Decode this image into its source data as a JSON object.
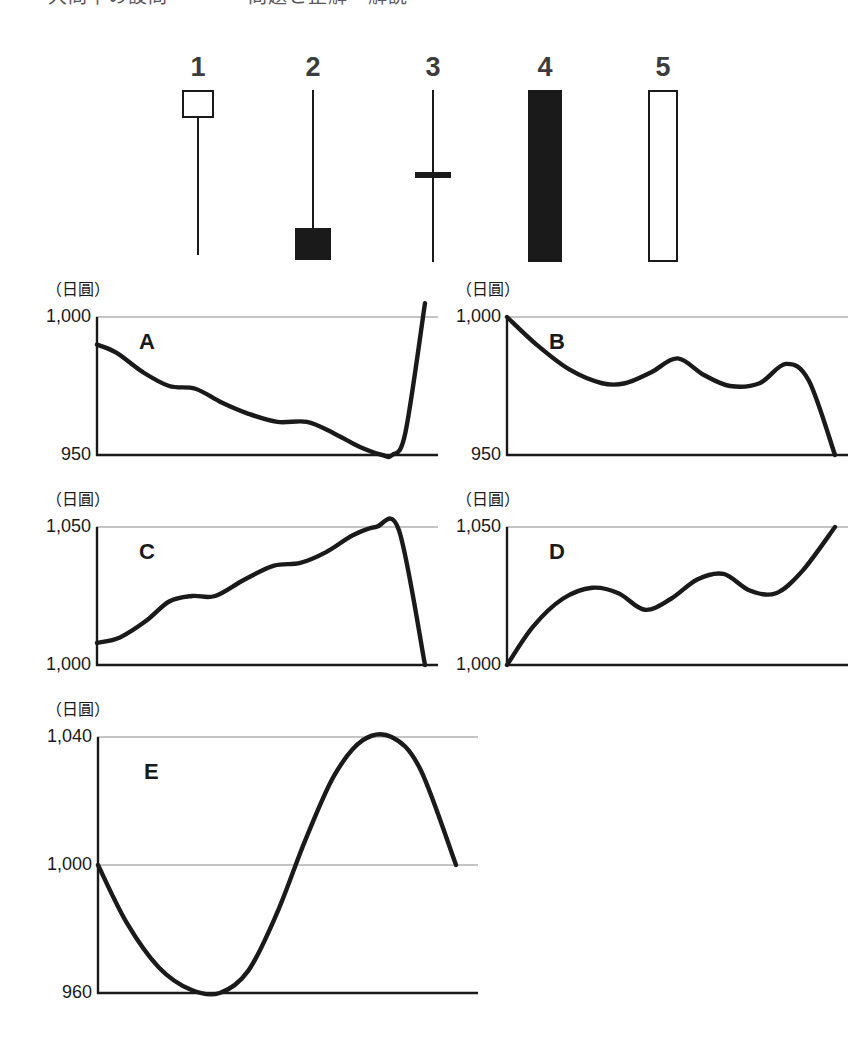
{
  "top_clipped_heading": "大問中の設問　　　　問題と正解・解説",
  "candlesticks": {
    "items": [
      {
        "label": "1",
        "icon": "candlestick-hollow-top-long-lower-wick",
        "type": "hollow",
        "body_top": 0,
        "body_height": 28,
        "body_width": 32,
        "wick_top": 28,
        "wick_height": 137
      },
      {
        "label": "2",
        "icon": "candlestick-filled-bottom-long-upper-wick",
        "type": "filled",
        "body_top": 138,
        "body_height": 32,
        "body_width": 36,
        "wick_top": 0,
        "wick_height": 140
      },
      {
        "label": "3",
        "icon": "candlestick-doji-cross",
        "type": "doji",
        "body_top": 82,
        "body_height": 6,
        "body_width": 36,
        "wick_top": 0,
        "wick_height": 172
      },
      {
        "label": "4",
        "icon": "candlestick-filled-tall-body",
        "type": "filled",
        "body_top": 0,
        "body_height": 172,
        "body_width": 34,
        "wick_top": 0,
        "wick_height": 0
      },
      {
        "label": "5",
        "icon": "candlestick-hollow-tall-body",
        "type": "hollow",
        "body_top": 0,
        "body_height": 172,
        "body_width": 30,
        "wick_top": 0,
        "wick_height": 0
      }
    ]
  },
  "chart_data": [
    {
      "id": "A",
      "letter": "A",
      "type": "line",
      "ylabel": "（日圓）",
      "ytick_labels": [
        "1,000",
        "950"
      ],
      "ylim": [
        950,
        1000
      ],
      "gridlines": [
        1000
      ],
      "axis_line": 950,
      "title": "",
      "xlabel": "",
      "x": [
        0,
        0.06,
        0.14,
        0.22,
        0.3,
        0.38,
        0.46,
        0.55,
        0.64,
        0.72,
        0.8,
        0.87,
        0.9,
        0.94,
        1.0
      ],
      "values": [
        990,
        987,
        980,
        975,
        974,
        969,
        965,
        962,
        962,
        958,
        953,
        950,
        950,
        958,
        1005
      ],
      "description": "Declines stepwise from 990 to a 950 low near the right, then rises sharply above 1,000"
    },
    {
      "id": "B",
      "letter": "B",
      "type": "line",
      "ylabel": "（日圓）",
      "ytick_labels": [
        "1,000",
        "950"
      ],
      "ylim": [
        950,
        1000
      ],
      "gridlines": [
        1000
      ],
      "axis_line": 950,
      "title": "",
      "xlabel": "",
      "x": [
        0,
        0.09,
        0.19,
        0.29,
        0.36,
        0.44,
        0.52,
        0.6,
        0.68,
        0.77,
        0.85,
        0.92,
        1.0
      ],
      "values": [
        1000,
        990,
        981,
        976,
        976,
        980,
        985,
        979,
        975,
        976,
        983,
        977,
        950
      ],
      "description": "Falls from 1,000 with two rebound bumps, then drops to 950 at the right"
    },
    {
      "id": "C",
      "letter": "C",
      "type": "line",
      "ylabel": "（日圓）",
      "ytick_labels": [
        "1,050",
        "1,000"
      ],
      "ylim": [
        1000,
        1050
      ],
      "gridlines": [
        1050
      ],
      "axis_line": 1000,
      "title": "",
      "xlabel": "",
      "x": [
        0,
        0.07,
        0.15,
        0.22,
        0.29,
        0.36,
        0.45,
        0.54,
        0.62,
        0.7,
        0.78,
        0.85,
        0.92,
        1.0
      ],
      "values": [
        1008,
        1010,
        1016,
        1023,
        1025,
        1025,
        1031,
        1036,
        1037,
        1041,
        1047,
        1050,
        1049,
        1000
      ],
      "description": "Rises stepwise from 1,008 to a 1,050 peak, then plunges to 1,000"
    },
    {
      "id": "D",
      "letter": "D",
      "type": "line",
      "ylabel": "（日圓）",
      "ytick_labels": [
        "1,050",
        "1,000"
      ],
      "ylim": [
        1000,
        1050
      ],
      "gridlines": [
        1050
      ],
      "axis_line": 1000,
      "title": "",
      "xlabel": "",
      "x": [
        0,
        0.08,
        0.17,
        0.26,
        0.34,
        0.42,
        0.5,
        0.58,
        0.66,
        0.74,
        0.82,
        0.9,
        1.0
      ],
      "values": [
        1000,
        1014,
        1024,
        1028,
        1026,
        1020,
        1024,
        1031,
        1033,
        1027,
        1026,
        1034,
        1050
      ],
      "description": "Climbs from 1,000 in two wave steps and finishes at 1,050"
    },
    {
      "id": "E",
      "letter": "E",
      "type": "line",
      "ylabel": "（日圓）",
      "ytick_labels": [
        "1,040",
        "1,000",
        "960"
      ],
      "ylim": [
        960,
        1040
      ],
      "gridlines": [
        1040,
        1000
      ],
      "axis_line": 960,
      "title": "",
      "xlabel": "",
      "x": [
        0,
        0.08,
        0.17,
        0.26,
        0.34,
        0.42,
        0.5,
        0.58,
        0.66,
        0.74,
        0.82,
        0.9,
        1.0
      ],
      "values": [
        1000,
        982,
        968,
        961,
        960,
        967,
        985,
        1008,
        1028,
        1039,
        1040,
        1030,
        1000
      ],
      "description": "Sine-like wave: falls from 1,000 to a 960 trough, peaks at 1,040, returns to 1,000"
    }
  ],
  "colors": {
    "ink": "#1a1a1a",
    "curve": "#1a1a1a",
    "gridline": "#8a8a8a",
    "background": "#ffffff",
    "label_gray": "#3c3c3c"
  }
}
